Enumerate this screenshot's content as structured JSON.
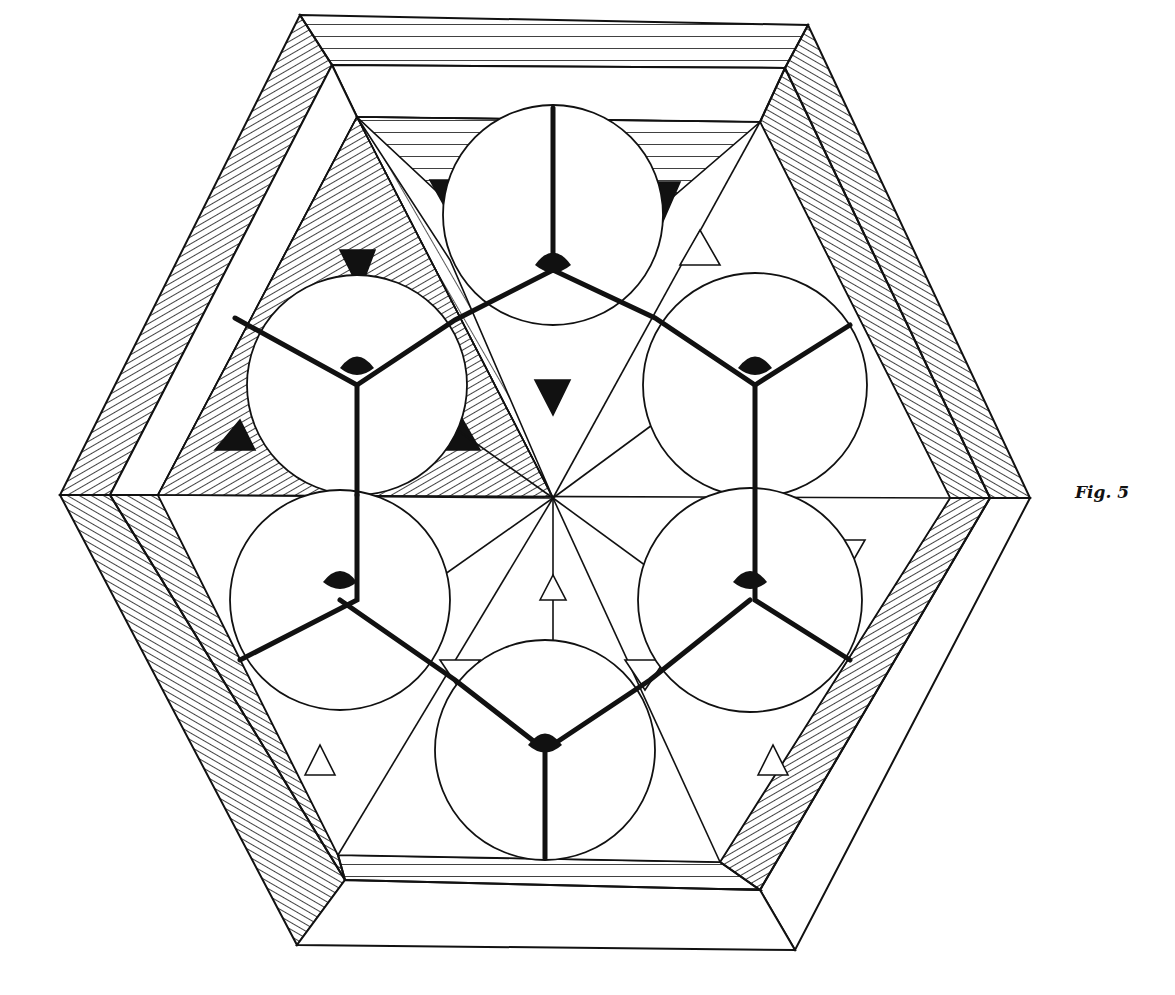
{
  "page": {
    "top_text_fragment": "",
    "caption": "Fig. 5"
  },
  "figure": {
    "ink_color": "#111111",
    "paper_color": "#ffffff",
    "center": [
      553,
      498
    ],
    "outer_hexagon": [
      [
        300,
        15
      ],
      [
        808,
        25
      ],
      [
        1030,
        498
      ],
      [
        795,
        950
      ],
      [
        297,
        945
      ],
      [
        60,
        495
      ]
    ],
    "mid_hexagon": [
      [
        332,
        65
      ],
      [
        785,
        68
      ],
      [
        990,
        498
      ],
      [
        760,
        890
      ],
      [
        345,
        880
      ],
      [
        110,
        495
      ]
    ],
    "inner_hexagon": [
      [
        357,
        117
      ],
      [
        760,
        122
      ],
      [
        950,
        498
      ],
      [
        720,
        862
      ],
      [
        338,
        855
      ],
      [
        158,
        495
      ]
    ],
    "circles": [
      {
        "name": "top",
        "cx": 553,
        "cy": 215,
        "r": 110
      },
      {
        "name": "upper-left",
        "cx": 357,
        "cy": 385,
        "r": 110
      },
      {
        "name": "upper-right",
        "cx": 755,
        "cy": 385,
        "r": 112
      },
      {
        "name": "lower-left",
        "cx": 340,
        "cy": 600,
        "r": 110
      },
      {
        "name": "lower-right",
        "cx": 750,
        "cy": 600,
        "r": 112
      },
      {
        "name": "bottom",
        "cx": 545,
        "cy": 750,
        "r": 110
      }
    ]
  }
}
